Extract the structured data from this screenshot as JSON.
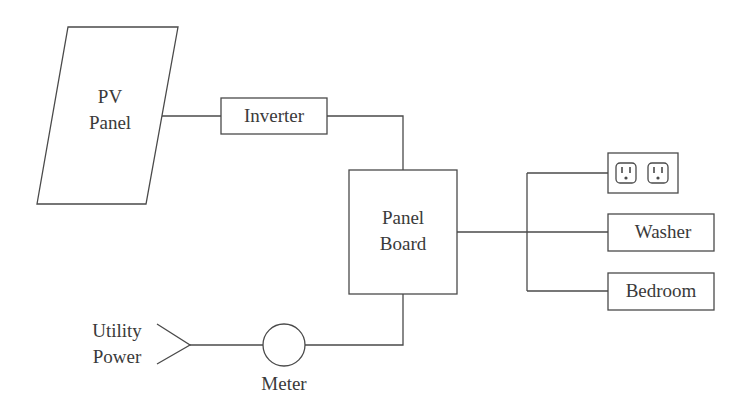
{
  "diagram": {
    "type": "electrical-block-diagram",
    "nodes": {
      "pv_panel": {
        "line1": "PV",
        "line2": "Panel",
        "shape": "parallelogram"
      },
      "inverter": {
        "label": "Inverter",
        "shape": "rectangle"
      },
      "panel_board": {
        "line1": "Panel",
        "line2": "Board",
        "shape": "rectangle"
      },
      "outlets": {
        "label": "",
        "shape": "rectangle",
        "icon": "duplex-outlet-icon",
        "count": 2
      },
      "washer": {
        "label": "Washer",
        "shape": "rectangle"
      },
      "bedroom": {
        "label": "Bedroom",
        "shape": "rectangle"
      },
      "meter": {
        "label": "Meter",
        "shape": "circle"
      },
      "utility_power": {
        "line1": "Utility",
        "line2": "Power",
        "shape": "input-arrow"
      }
    },
    "edges": [
      {
        "from": "pv_panel",
        "to": "inverter"
      },
      {
        "from": "inverter",
        "to": "panel_board"
      },
      {
        "from": "utility_power",
        "to": "meter"
      },
      {
        "from": "meter",
        "to": "panel_board"
      },
      {
        "from": "panel_board",
        "to": "outlets"
      },
      {
        "from": "panel_board",
        "to": "washer"
      },
      {
        "from": "panel_board",
        "to": "bedroom"
      }
    ],
    "colors": {
      "line": "#4a4a4a",
      "text": "#3a3a3a",
      "background": "#ffffff"
    }
  }
}
